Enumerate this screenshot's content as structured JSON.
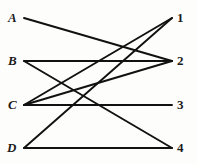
{
  "figure": {
    "type": "bipartite-graph-diagram",
    "background_color": "#fdfdfb",
    "edge_color": "#111111",
    "label_color": "#1b1b1b",
    "width": 197,
    "height": 164
  },
  "left_nodes": [
    {
      "id": "A",
      "label": "A",
      "x": 24,
      "y": 18,
      "label_x": 8,
      "label_y": 11
    },
    {
      "id": "B",
      "label": "B",
      "x": 24,
      "y": 61,
      "label_x": 8,
      "label_y": 54
    },
    {
      "id": "C",
      "label": "C",
      "x": 24,
      "y": 105,
      "label_x": 8,
      "label_y": 98
    },
    {
      "id": "D",
      "label": "D",
      "x": 24,
      "y": 148,
      "label_x": 7,
      "label_y": 141
    }
  ],
  "right_nodes": [
    {
      "id": "1",
      "label": "1",
      "x": 172,
      "y": 18,
      "label_x": 177,
      "label_y": 11
    },
    {
      "id": "2",
      "label": "2",
      "x": 172,
      "y": 61,
      "label_x": 177,
      "label_y": 54
    },
    {
      "id": "3",
      "label": "3",
      "x": 172,
      "y": 105,
      "label_x": 177,
      "label_y": 98
    },
    {
      "id": "4",
      "label": "4",
      "x": 172,
      "y": 148,
      "label_x": 177,
      "label_y": 141
    }
  ],
  "edges": [
    {
      "id": "A-2",
      "from": "A",
      "to": "2",
      "x1": 24,
      "y1": 18,
      "x2": 172,
      "y2": 61
    },
    {
      "id": "B-2",
      "from": "B",
      "to": "2",
      "x1": 24,
      "y1": 61,
      "x2": 172,
      "y2": 61
    },
    {
      "id": "B-4",
      "from": "B",
      "to": "4",
      "x1": 24,
      "y1": 61,
      "x2": 172,
      "y2": 148
    },
    {
      "id": "C-1",
      "from": "C",
      "to": "1",
      "x1": 24,
      "y1": 105,
      "x2": 172,
      "y2": 18
    },
    {
      "id": "C-2",
      "from": "C",
      "to": "2",
      "x1": 24,
      "y1": 105,
      "x2": 172,
      "y2": 61
    },
    {
      "id": "C-3",
      "from": "C",
      "to": "3",
      "x1": 24,
      "y1": 105,
      "x2": 172,
      "y2": 105
    },
    {
      "id": "D-1",
      "from": "D",
      "to": "1",
      "x1": 24,
      "y1": 148,
      "x2": 172,
      "y2": 18
    },
    {
      "id": "D-4",
      "from": "D",
      "to": "4",
      "x1": 24,
      "y1": 148,
      "x2": 172,
      "y2": 148
    }
  ]
}
